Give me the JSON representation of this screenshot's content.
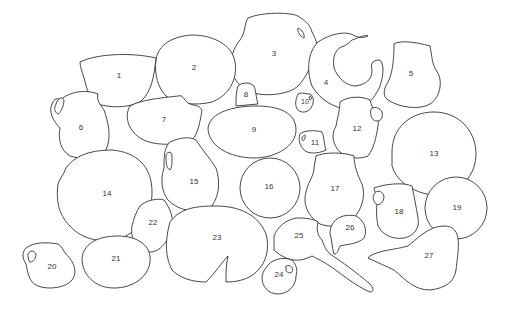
{
  "diagram": {
    "type": "numbered vessel outline layout",
    "line_color": "#333333",
    "background": "#ffffff",
    "labels": [
      {
        "id": "1",
        "text": "1",
        "x": 119,
        "y": 76
      },
      {
        "id": "2",
        "text": "2",
        "x": 194,
        "y": 68
      },
      {
        "id": "3",
        "text": "3",
        "x": 274,
        "y": 54
      },
      {
        "id": "4",
        "text": "4",
        "x": 326,
        "y": 83
      },
      {
        "id": "5",
        "text": "5",
        "x": 411,
        "y": 74
      },
      {
        "id": "6",
        "text": "6",
        "x": 81,
        "y": 128
      },
      {
        "id": "7",
        "text": "7",
        "x": 164,
        "y": 120
      },
      {
        "id": "8",
        "text": "8",
        "x": 246,
        "y": 95
      },
      {
        "id": "9",
        "text": "9",
        "x": 254,
        "y": 130
      },
      {
        "id": "10",
        "text": "10",
        "x": 305,
        "y": 102
      },
      {
        "id": "11",
        "text": "11",
        "x": 315,
        "y": 143
      },
      {
        "id": "12",
        "text": "12",
        "x": 357,
        "y": 129
      },
      {
        "id": "13",
        "text": "13",
        "x": 434,
        "y": 154
      },
      {
        "id": "14",
        "text": "14",
        "x": 107,
        "y": 194
      },
      {
        "id": "15",
        "text": "15",
        "x": 194,
        "y": 182
      },
      {
        "id": "16",
        "text": "16",
        "x": 269,
        "y": 187
      },
      {
        "id": "17",
        "text": "17",
        "x": 335,
        "y": 189
      },
      {
        "id": "18",
        "text": "18",
        "x": 399,
        "y": 212
      },
      {
        "id": "19",
        "text": "19",
        "x": 457,
        "y": 208
      },
      {
        "id": "20",
        "text": "20",
        "x": 52,
        "y": 267
      },
      {
        "id": "21",
        "text": "21",
        "x": 116,
        "y": 259
      },
      {
        "id": "22",
        "text": "22",
        "x": 153,
        "y": 223
      },
      {
        "id": "23",
        "text": "23",
        "x": 217,
        "y": 238
      },
      {
        "id": "24",
        "text": "24",
        "x": 279,
        "y": 275
      },
      {
        "id": "25",
        "text": "25",
        "x": 299,
        "y": 236
      },
      {
        "id": "26",
        "text": "26",
        "x": 350,
        "y": 228
      },
      {
        "id": "27",
        "text": "27",
        "x": 429,
        "y": 256
      }
    ]
  }
}
